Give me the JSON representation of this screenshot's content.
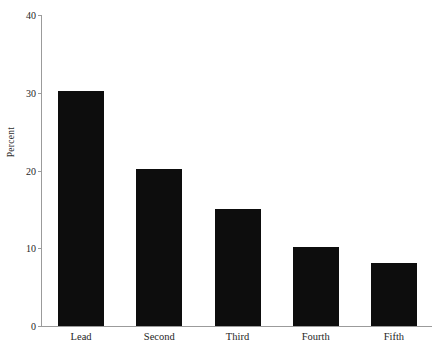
{
  "chart_data": {
    "type": "bar",
    "title": "",
    "subtitle": "",
    "xlabel": "",
    "ylabel": "Percent",
    "categories": [
      "Lead",
      "Second",
      "Third",
      "Fourth",
      "Fifth"
    ],
    "values": [
      30.2,
      20.2,
      15.1,
      10.1,
      8.1
    ],
    "ylim": [
      0,
      40
    ],
    "ytick_labels": [
      "0",
      "10",
      "20",
      "30",
      "40"
    ],
    "ytick_values": [
      0,
      10,
      20,
      30,
      40
    ],
    "grid": false,
    "legend": false,
    "legend_position": "none",
    "bar_color": "#0d0d0d",
    "axis_color": "#9b9b9b",
    "text_color": "#262626",
    "background_color": "#ffffff"
  }
}
